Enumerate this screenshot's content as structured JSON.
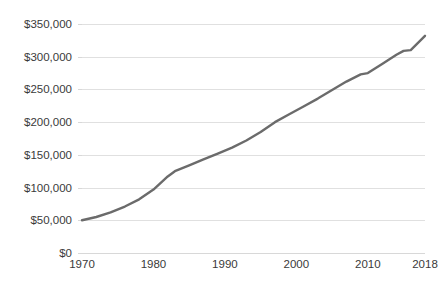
{
  "chart_data": {
    "type": "line",
    "title": "",
    "subtitle": "",
    "xlabel": "",
    "ylabel": "",
    "grid": "horizontal",
    "legend": "none",
    "xlim": [
      1970,
      2018
    ],
    "ylim": [
      0,
      350000
    ],
    "x_tick_labels": [
      "1970",
      "1980",
      "1990",
      "2000",
      "2010",
      "2018"
    ],
    "x_ticks": [
      1970,
      1980,
      1990,
      2000,
      2010,
      2018
    ],
    "y_tick_labels": [
      "$0",
      "$50,000",
      "$100,000",
      "$150,000",
      "$200,000",
      "$250,000",
      "$300,000",
      "$350,000"
    ],
    "y_ticks": [
      0,
      50000,
      100000,
      150000,
      200000,
      250000,
      300000,
      350000
    ],
    "series": [
      {
        "name": "Value",
        "color": "#6b6b6b",
        "x": [
          1970,
          1972,
          1974,
          1976,
          1978,
          1980,
          1982,
          1983,
          1985,
          1987,
          1989,
          1991,
          1993,
          1995,
          1997,
          1999,
          2001,
          2003,
          2005,
          2007,
          2009,
          2010,
          2012,
          2014,
          2015,
          2016,
          2018
        ],
        "values": [
          50000,
          55000,
          62000,
          71000,
          82000,
          97000,
          117000,
          125000,
          134000,
          143000,
          152000,
          161000,
          172000,
          185000,
          200000,
          212000,
          224000,
          236000,
          249000,
          262000,
          273000,
          275000,
          289000,
          303000,
          309000,
          310000,
          332000
        ]
      }
    ]
  },
  "colors": {
    "background": "#ffffff",
    "gridline": "#e0e0e0",
    "axis": "#d8d8d8",
    "text": "#3a3a3a",
    "line": "#6b6b6b"
  }
}
